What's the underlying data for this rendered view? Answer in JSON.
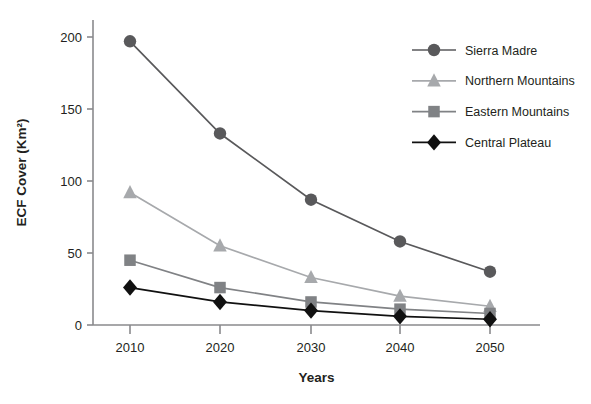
{
  "chart_data": {
    "type": "line",
    "title": "",
    "xlabel": "Years",
    "ylabel": "ECF Cover (Km²)",
    "categories": [
      "2010",
      "2020",
      "2030",
      "2040",
      "2050"
    ],
    "x": [
      2010,
      2020,
      2030,
      2040,
      2050
    ],
    "xlim": [
      2005,
      2055
    ],
    "ylim": [
      0,
      210
    ],
    "yticks": [
      0,
      50,
      100,
      150,
      200
    ],
    "ytick_labels": [
      "0",
      "50",
      "100",
      "150",
      "200"
    ],
    "xticks": [
      2010,
      2020,
      2030,
      2040,
      2050
    ],
    "xtick_labels": [
      "2010",
      "2020",
      "2030",
      "2040",
      "2050"
    ],
    "grid": false,
    "legend_position": "top-right",
    "series": [
      {
        "name": "Sierra Madre",
        "marker": "circle",
        "color": "#59595b",
        "values": [
          197,
          133,
          87,
          58,
          37
        ]
      },
      {
        "name": "Northern Mountains",
        "marker": "triangle",
        "color": "#a7a9ac",
        "values": [
          92,
          55,
          33,
          20,
          13
        ]
      },
      {
        "name": "Eastern Mountains",
        "marker": "square",
        "color": "#808285",
        "values": [
          45,
          26,
          16,
          11,
          8
        ]
      },
      {
        "name": "Central Plateau",
        "marker": "diamond",
        "color": "#111111",
        "values": [
          26,
          16,
          10,
          6,
          4
        ]
      }
    ]
  },
  "axis": {
    "y_title": "ECF Cover (Km²)",
    "x_title": "Years",
    "axis_color": "#8a8a8d"
  },
  "legend": {
    "items": [
      {
        "label": "Sierra Madre",
        "marker": "circle",
        "color": "#59595b"
      },
      {
        "label": "Northern Mountains",
        "marker": "triangle",
        "color": "#a7a9ac"
      },
      {
        "label": "Eastern Mountains",
        "marker": "square",
        "color": "#808285"
      },
      {
        "label": "Central Plateau",
        "marker": "diamond",
        "color": "#111111"
      }
    ]
  }
}
